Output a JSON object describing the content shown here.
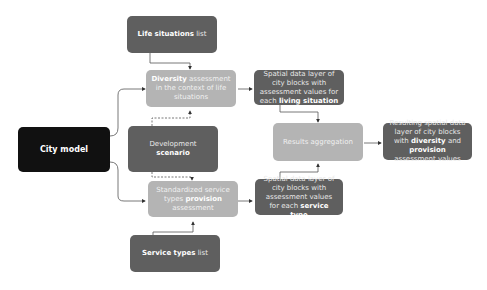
{
  "nodes": {
    "city_model": {
      "label": "City model"
    },
    "life_situations": {
      "bold": "Life situations",
      "rest": " list"
    },
    "diversity": {
      "bold": "Diversity",
      "rest": " assessment in the context of life situations"
    },
    "development": {
      "pre": "Development ",
      "bold": "scenario"
    },
    "provision": {
      "pre": "Standardized service types ",
      "bold": "provision",
      "rest": " assessment"
    },
    "service_types": {
      "bold": "Service types",
      "rest": " list"
    },
    "living_layer": {
      "pre": "Spatial data layer of city blocks with assessment values for each ",
      "bold": "living situation"
    },
    "service_layer": {
      "pre": "Spatial data layer of city blocks with assessment values for each ",
      "bold": "service type"
    },
    "aggregation": {
      "label": "Results aggregation"
    },
    "result": {
      "pre": "Resulting spatial data layer of city blocks with ",
      "bold1": "diversity",
      "mid": " and ",
      "bold2": "provision",
      "rest": " assessment values"
    }
  },
  "colors": {
    "dark": "#5f5f5f",
    "light": "#b4b4b4",
    "black": "#111111",
    "edge": "#333333"
  }
}
